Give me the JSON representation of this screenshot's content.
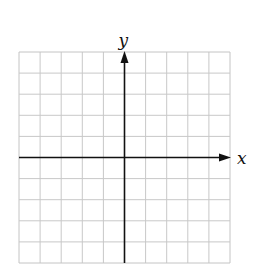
{
  "diagram": {
    "type": "coordinate-grid",
    "grid": {
      "columns": 10,
      "rows": 10,
      "left": 19,
      "top": 52,
      "cell_size": 21.1,
      "line_color": "#c8c8c8",
      "border_color": "#c4c4c4"
    },
    "axes": {
      "origin_column": 5,
      "origin_row": 5,
      "color": "#111111",
      "x_label": "x",
      "y_label": "y"
    }
  }
}
